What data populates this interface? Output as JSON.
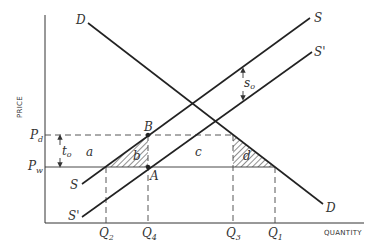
{
  "diagram": {
    "axes": {
      "y_label": "PRICE",
      "x_label": "QUANTITY"
    },
    "price_labels": {
      "pd_main": "P",
      "pd_sub": "d",
      "pw_main": "P",
      "pw_sub": "w"
    },
    "quantity_labels": [
      {
        "id": "q2",
        "main": "Q",
        "sub": "2"
      },
      {
        "id": "q4",
        "main": "Q",
        "sub": "4"
      },
      {
        "id": "q3",
        "main": "Q",
        "sub": "3"
      },
      {
        "id": "q1",
        "main": "Q",
        "sub": "1"
      }
    ],
    "curves": {
      "demand_top": "D",
      "demand_bottom": "D",
      "supply_top": "S",
      "supply_bottom": "S",
      "supply_shifted_top": "S'",
      "supply_shifted_bottom": "S'"
    },
    "points": {
      "a_point": "A",
      "b_point": "B"
    },
    "areas": {
      "a": "a",
      "b": "b",
      "c": "c",
      "d": "d"
    },
    "markers": {
      "tariff_main": "t",
      "tariff_sub": "o",
      "subsidy_main": "s",
      "subsidy_sub": "o"
    },
    "colors": {
      "ink": "#222222",
      "background": "#ffffff"
    }
  }
}
